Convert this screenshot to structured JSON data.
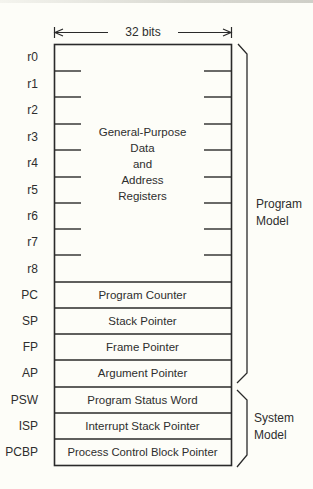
{
  "diagram": {
    "width_label": "32 bits",
    "general_purpose": {
      "lines": [
        "General-Purpose",
        "Data",
        "and",
        "Address",
        "Registers"
      ]
    },
    "registers": [
      {
        "name": "r0",
        "description": ""
      },
      {
        "name": "r1",
        "description": ""
      },
      {
        "name": "r2",
        "description": ""
      },
      {
        "name": "r3",
        "description": ""
      },
      {
        "name": "r4",
        "description": ""
      },
      {
        "name": "r5",
        "description": ""
      },
      {
        "name": "r6",
        "description": ""
      },
      {
        "name": "r7",
        "description": ""
      },
      {
        "name": "r8",
        "description": ""
      },
      {
        "name": "PC",
        "description": "Program Counter"
      },
      {
        "name": "SP",
        "description": "Stack Pointer"
      },
      {
        "name": "FP",
        "description": "Frame Pointer"
      },
      {
        "name": "AP",
        "description": "Argument Pointer"
      },
      {
        "name": "PSW",
        "description": "Program Status Word"
      },
      {
        "name": "ISP",
        "description": "Interrupt Stack Pointer"
      },
      {
        "name": "PCBP",
        "description": "Process Control Block Pointer"
      }
    ],
    "groups": [
      {
        "label_line1": "Program",
        "label_line2": "Model",
        "range": "r0-AP"
      },
      {
        "label_line1": "System",
        "label_line2": "Model",
        "range": "PSW-PCBP"
      }
    ],
    "colors": {
      "line": "#2a2a2a",
      "background": "#fdfdf8",
      "text": "#2e2e2e"
    }
  }
}
